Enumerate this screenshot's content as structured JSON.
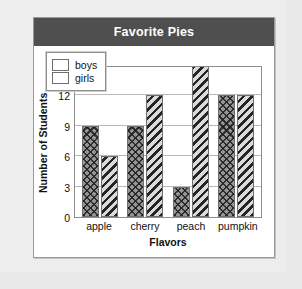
{
  "card": {
    "title": "Favorite Pies"
  },
  "chart_data": {
    "type": "bar",
    "title": "Favorite Pies",
    "xlabel": "Flavors",
    "ylabel": "Number of Students",
    "categories": [
      "apple",
      "cherry",
      "peach",
      "pumpkin"
    ],
    "series": [
      {
        "name": "boys",
        "values": [
          9,
          9,
          3,
          12
        ]
      },
      {
        "name": "girls",
        "values": [
          6,
          12,
          15,
          12
        ]
      }
    ],
    "ylim": [
      0,
      15
    ],
    "yticks": [
      0,
      3,
      6,
      9,
      12,
      15
    ],
    "grid": true,
    "legend_position": "top-left"
  },
  "colors": {
    "header_bg": "#4f4f4f",
    "header_text": "#ffffff",
    "card_bg": "#ffffff",
    "page_bg": "#e9e9e9",
    "grid": "#b9b9b9",
    "axis": "#8d8d8d",
    "boys_fill": "#949494",
    "girls_fill": "#8a8a8a"
  }
}
